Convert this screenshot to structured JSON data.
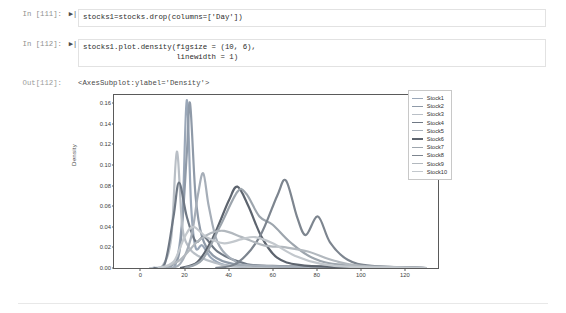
{
  "notebook": {
    "cells": [
      {
        "prompt": "In [111]:",
        "run_marker": "▶|",
        "code": "stocks1=stocks.drop(columns=['Day'])"
      },
      {
        "prompt": "In [112]:",
        "run_marker": "▶|",
        "code": "stocks1.plot.density(figsize = (10, 6),\n                     linewidth = 1)"
      }
    ],
    "output": {
      "prompt": "Out[112]:",
      "text": "<AxesSubplot:ylabel='Density'>"
    }
  },
  "chart_data": {
    "type": "line",
    "title": "",
    "xlabel": "",
    "ylabel": "Density",
    "xlim": [
      -12,
      135
    ],
    "ylim": [
      0.0,
      0.168
    ],
    "xticks": [
      0,
      20,
      40,
      60,
      80,
      100,
      120
    ],
    "xticklabels": [
      "0",
      "20",
      "40",
      "60",
      "80",
      "100",
      "120"
    ],
    "yticks": [
      0.0,
      0.02,
      0.04,
      0.06,
      0.08,
      0.1,
      0.12,
      0.14,
      0.16
    ],
    "yticklabels": [
      "0.00",
      "0.02",
      "0.04",
      "0.06",
      "0.08",
      "0.10",
      "0.12",
      "0.14",
      "0.16"
    ],
    "grid": false,
    "legend_position": "upper right",
    "legend_entries": [
      "Stock1",
      "Stock2",
      "Stock3",
      "Stock4",
      "Stock5",
      "Stock6",
      "Stock7",
      "Stock8",
      "Stock9",
      "Stock10"
    ],
    "colors": [
      "#9aa7b8",
      "#8f9aa8",
      "#b9bfc6",
      "#6f7884",
      "#a6aeb8",
      "#5d646e",
      "#9da5ad",
      "#7d858f",
      "#b2b8be",
      "#c3c8cd"
    ],
    "series": [
      {
        "name": "Stock1",
        "color": "#9aa7b8",
        "peaks": [
          {
            "center": 21.5,
            "height": 0.163,
            "width": 1.6
          },
          {
            "center": 27.5,
            "height": 0.022,
            "width": 4.0
          }
        ],
        "points": [
          [
            5,
            0
          ],
          [
            12,
            0.001
          ],
          [
            16,
            0.004
          ],
          [
            19,
            0.05
          ],
          [
            21,
            0.163
          ],
          [
            23,
            0.06
          ],
          [
            25,
            0.02
          ],
          [
            28,
            0.022
          ],
          [
            32,
            0.01
          ],
          [
            38,
            0.003
          ],
          [
            48,
            0.001
          ],
          [
            70,
            0
          ],
          [
            130,
            0
          ]
        ]
      },
      {
        "name": "Stock2",
        "color": "#8f9aa8",
        "peaks": [
          {
            "center": 22.5,
            "height": 0.16,
            "width": 1.8
          }
        ],
        "points": [
          [
            8,
            0
          ],
          [
            14,
            0.002
          ],
          [
            18,
            0.02
          ],
          [
            21,
            0.11
          ],
          [
            22.5,
            0.16
          ],
          [
            25,
            0.07
          ],
          [
            28,
            0.03
          ],
          [
            33,
            0.012
          ],
          [
            42,
            0.004
          ],
          [
            60,
            0.001
          ],
          [
            130,
            0
          ]
        ]
      },
      {
        "name": "Stock3",
        "color": "#b9bfc6",
        "peaks": [
          {
            "center": 16.5,
            "height": 0.113,
            "width": 1.4
          }
        ],
        "points": [
          [
            4,
            0
          ],
          [
            10,
            0.002
          ],
          [
            14,
            0.03
          ],
          [
            16.5,
            0.113
          ],
          [
            19,
            0.04
          ],
          [
            22,
            0.02
          ],
          [
            26,
            0.012
          ],
          [
            34,
            0.005
          ],
          [
            50,
            0.001
          ],
          [
            130,
            0
          ]
        ]
      },
      {
        "name": "Stock4",
        "color": "#6f7884",
        "peaks": [
          {
            "center": 17.5,
            "height": 0.083,
            "width": 3.2
          },
          {
            "center": 29.0,
            "height": 0.03,
            "width": 5.0
          }
        ],
        "points": [
          [
            6,
            0
          ],
          [
            11,
            0.004
          ],
          [
            15,
            0.05
          ],
          [
            17.5,
            0.083
          ],
          [
            21,
            0.05
          ],
          [
            25,
            0.026
          ],
          [
            29,
            0.03
          ],
          [
            35,
            0.016
          ],
          [
            45,
            0.006
          ],
          [
            60,
            0.002
          ],
          [
            130,
            0
          ]
        ]
      },
      {
        "name": "Stock5",
        "color": "#a6aeb8",
        "peaks": [
          {
            "center": 28.5,
            "height": 0.092,
            "width": 2.4
          }
        ],
        "points": [
          [
            12,
            0
          ],
          [
            18,
            0.004
          ],
          [
            23,
            0.03
          ],
          [
            26,
            0.07
          ],
          [
            28.5,
            0.092
          ],
          [
            31,
            0.06
          ],
          [
            35,
            0.025
          ],
          [
            42,
            0.008
          ],
          [
            55,
            0.002
          ],
          [
            130,
            0
          ]
        ]
      },
      {
        "name": "Stock6",
        "color": "#5d646e",
        "peaks": [
          {
            "center": 44.0,
            "height": 0.079,
            "width": 5.0
          }
        ],
        "points": [
          [
            18,
            0
          ],
          [
            26,
            0.006
          ],
          [
            33,
            0.03
          ],
          [
            40,
            0.065
          ],
          [
            44,
            0.079
          ],
          [
            49,
            0.06
          ],
          [
            55,
            0.03
          ],
          [
            62,
            0.01
          ],
          [
            72,
            0.003
          ],
          [
            90,
            0.001
          ],
          [
            130,
            0
          ]
        ]
      },
      {
        "name": "Stock7",
        "color": "#9da5ad",
        "peaks": [
          {
            "center": 46.5,
            "height": 0.075,
            "width": 6.5
          },
          {
            "center": 60.0,
            "height": 0.042,
            "width": 6.0
          }
        ],
        "points": [
          [
            20,
            0
          ],
          [
            28,
            0.008
          ],
          [
            36,
            0.04
          ],
          [
            44,
            0.074
          ],
          [
            48,
            0.072
          ],
          [
            54,
            0.05
          ],
          [
            60,
            0.042
          ],
          [
            68,
            0.025
          ],
          [
            78,
            0.01
          ],
          [
            92,
            0.003
          ],
          [
            130,
            0
          ]
        ]
      },
      {
        "name": "Stock8",
        "color": "#7d858f",
        "peaks": [
          {
            "center": 66.0,
            "height": 0.085,
            "width": 5.5
          },
          {
            "center": 80.5,
            "height": 0.05,
            "width": 4.0
          }
        ],
        "points": [
          [
            34,
            0
          ],
          [
            44,
            0.005
          ],
          [
            54,
            0.03
          ],
          [
            62,
            0.07
          ],
          [
            66,
            0.085
          ],
          [
            71,
            0.05
          ],
          [
            75,
            0.032
          ],
          [
            80.5,
            0.05
          ],
          [
            86,
            0.025
          ],
          [
            94,
            0.008
          ],
          [
            105,
            0.002
          ],
          [
            130,
            0
          ]
        ]
      },
      {
        "name": "Stock9",
        "color": "#b2b8be",
        "peaks": [
          {
            "center": 38.0,
            "height": 0.036,
            "width": 12.0
          }
        ],
        "points": [
          [
            10,
            0
          ],
          [
            18,
            0.008
          ],
          [
            26,
            0.026
          ],
          [
            32,
            0.034
          ],
          [
            38,
            0.036
          ],
          [
            46,
            0.03
          ],
          [
            56,
            0.022
          ],
          [
            66,
            0.02
          ],
          [
            76,
            0.016
          ],
          [
            88,
            0.007
          ],
          [
            100,
            0.002
          ],
          [
            130,
            0
          ]
        ]
      },
      {
        "name": "Stock10",
        "color": "#c3c8cd",
        "peaks": [
          {
            "center": 24.0,
            "height": 0.04,
            "width": 7.0
          },
          {
            "center": 52.0,
            "height": 0.03,
            "width": 9.0
          }
        ],
        "points": [
          [
            8,
            0
          ],
          [
            15,
            0.006
          ],
          [
            20,
            0.03
          ],
          [
            24,
            0.04
          ],
          [
            30,
            0.03
          ],
          [
            38,
            0.024
          ],
          [
            46,
            0.028
          ],
          [
            52,
            0.03
          ],
          [
            60,
            0.024
          ],
          [
            70,
            0.012
          ],
          [
            82,
            0.004
          ],
          [
            96,
            0.001
          ],
          [
            130,
            0
          ]
        ]
      }
    ]
  }
}
